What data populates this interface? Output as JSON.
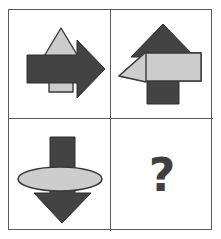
{
  "puzzle": {
    "title": "Visual analogy matrix",
    "grid": {
      "rows": 2,
      "cols": 2
    },
    "answer_placeholder": "?",
    "colors": {
      "dark_shape": "#434343",
      "light_shape": "#cdcdcd",
      "shape_outline": "#3a3a3a",
      "frame_border": "#5a5a5a",
      "background": "#ffffff",
      "question_mark": "#3f3f3f"
    },
    "cells": [
      {
        "position": "top-left",
        "label": "Cell 1",
        "shapes": [
          {
            "name": "up-arrow",
            "fill": "light",
            "direction": "up",
            "layer": "back"
          },
          {
            "name": "right-arrow",
            "fill": "dark",
            "direction": "right",
            "layer": "front"
          }
        ]
      },
      {
        "position": "top-right",
        "label": "Cell 2",
        "shapes": [
          {
            "name": "up-arrow",
            "fill": "dark",
            "direction": "up",
            "layer": "back"
          },
          {
            "name": "left-arrow",
            "fill": "light",
            "direction": "left",
            "layer": "front"
          }
        ]
      },
      {
        "position": "bottom-left",
        "label": "Cell 3",
        "shapes": [
          {
            "name": "down-arrow",
            "fill": "dark",
            "direction": "down",
            "layer": "back"
          },
          {
            "name": "ellipse",
            "fill": "light",
            "direction": "none",
            "layer": "front"
          }
        ]
      },
      {
        "position": "bottom-right",
        "label": "Cell 4",
        "shapes": [
          {
            "name": "question-mark",
            "fill": "dark",
            "direction": "none",
            "layer": "front"
          }
        ]
      }
    ]
  }
}
